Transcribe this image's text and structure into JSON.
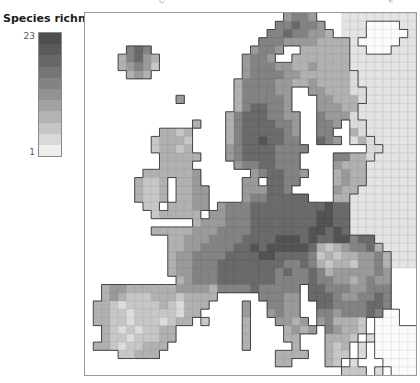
{
  "legend": {
    "title": "Species richness",
    "max_label": "23",
    "min_label": "1",
    "colors": [
      "#4e4e4c",
      "#5a5a58",
      "#676765",
      "#757573",
      "#838381",
      "#929290",
      "#a2a2a0",
      "#b3b3b1",
      "#c5c5c3",
      "#d9d9d7",
      "#eeeeec"
    ],
    "frame_color": "#8a8a8a"
  },
  "map": {
    "region": "Europe",
    "value_min": 1,
    "value_max": 23,
    "sea_color": "#ffffff",
    "frame_color": "#9a9a9a",
    "coast_color": "#383838",
    "nodata_hatch_color": "rgba(140,140,140,0.22)",
    "cell_grid_color": "rgba(0,0,0,0.07)",
    "palette": {
      "1": "#f1f1ef",
      "2": "#dcdcda",
      "3": "#c7c7c5",
      "4": "#b1b1af",
      "5": "#9a9a98",
      "6": "#838381",
      "7": "#6a6a68",
      "8": "#535351",
      "x": "#e4e4e2",
      "o": "#fcfcfb"
    },
    "grid": [
      "........................5665...xxxxxxxxx",
      ".......................667665..xxxooooxx",
      "......................66766554.xxxooooox",
      ".....................66655554444xoooooxx",
      ".....676............5665..444444xxoooxxx",
      "....46754..........5665..4444444xxxxxxxx",
      "....45653..........5666554454444xxxxxxxx",
      ".....454...........56666554444442xxxxxxx",
      "..................466665544544442xxxxxxx",
      "..................4666655..5544422xxxxxx",
      "...........5......4666665...554442xxxxxx",
      "..................4677665...55544xxxxxxx",
      ".................467776655..65552xxxxxxx",
      ".............4...467777665..665.22xxxxxx",
      ".........4434....467777765..66..42xxxxxx",
      "........34443....467787766..765.242xxxxx",
      "........34434....5677776666.......22xxxx",
      ".........44444...567777666....66442xxxxx",
      ".........4444.....56677666....5444xxxxxx",
      ".......4444445......5677665...4544xxxxxx",
      "......4334.445.....55.7766....4544xxxxxx",
      "......4334.4455....555776.....544xxxxxxx",
      "......4334.4455....56677777...44xxxxxxxx",
      ".......33.44455.5666777777777877xxxxxxxx",
      "........344444.55666777777778877xxxxxxxx",
      ".............4555666777777778877xxxxxxxx",
      "........444445556666777777788787xxxxxxxx",
      "..........4455566667777888787788677xxxxx",
      "..........44556666778788888743456674xxxx",
      "..........455666677778877776343445564xxx",
      "..........455666777777776676434435564xxx",
      "..........455666777777767667645555565...",
      "...........45666777777766667665545655...",
      "..455444444555546666766666.7766655666...",
      "..45433344434444.....66655.7776556676...",
      ".44323333432444....5..6655..776666776...",
      ".4433233333244.....5..5655..66566676oo..",
      ".443323332344.3....4...5545.564443.ooo..",
      "..432323344........4....4545.65443.ooooo",
      "..433233344........4....44...4443.2ooooo",
      ".443233444.........4.....4...434.2.ooooo",
      "....33444..............4444..433.2.ooooo",
      ".......................44....43.2...oooo",
      "...............................333.2.ooo"
    ]
  },
  "artifacts": {
    "top_left_mark": "cropped-text-fragment",
    "top_right_mark": "cropped-text-fragment"
  }
}
